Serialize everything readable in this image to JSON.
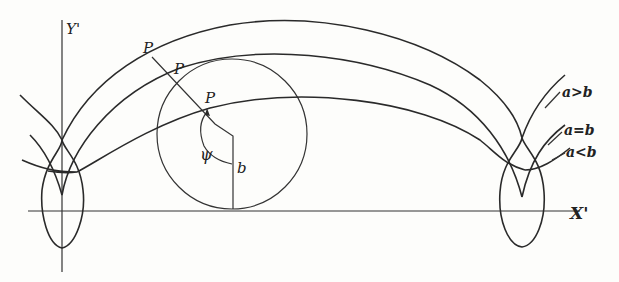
{
  "diagram": {
    "axes": {
      "x_label": "X'",
      "y_label": "Y'"
    },
    "point_labels": [
      "P",
      "P",
      "P"
    ],
    "angle_label": "ψ",
    "radius_label": "b",
    "curve_labels": {
      "prolate": "a>b",
      "cycloid": "a=b",
      "curtate": "a<b"
    },
    "colors": {
      "ink": "#2a2a2a",
      "paper": "#fdfdfb"
    }
  }
}
